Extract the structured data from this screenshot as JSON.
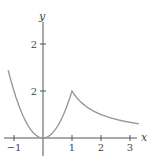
{
  "chart_data": {
    "type": "line",
    "title": "",
    "xlabel": "x",
    "ylabel": "y",
    "xlim": [
      -1.3,
      3.35
    ],
    "ylim": [
      -0.6,
      3.6
    ],
    "grid": false,
    "legend": null,
    "x_ticks": [
      {
        "value": -1,
        "label": "−1"
      },
      {
        "value": 1,
        "label": "1"
      },
      {
        "value": 2,
        "label": "2"
      },
      {
        "value": 3,
        "label": "3"
      }
    ],
    "y_ticks": [
      {
        "value": 2,
        "label": "2"
      },
      {
        "value": 4,
        "label": "2"
      }
    ],
    "series": [
      {
        "name": "f(x)",
        "color": "#999999",
        "description": "2x^2 for x<=1, 2/x for x>1",
        "points": [
          [
            -1.2,
            2.88
          ],
          [
            -1.0,
            2.0
          ],
          [
            -0.8,
            1.28
          ],
          [
            -0.6,
            0.72
          ],
          [
            -0.4,
            0.32
          ],
          [
            -0.2,
            0.08
          ],
          [
            0.0,
            0.0
          ],
          [
            0.2,
            0.08
          ],
          [
            0.4,
            0.32
          ],
          [
            0.6,
            0.72
          ],
          [
            0.8,
            1.28
          ],
          [
            1.0,
            2.0
          ],
          [
            1.25,
            1.6
          ],
          [
            1.5,
            1.333
          ],
          [
            1.75,
            1.143
          ],
          [
            2.0,
            1.0
          ],
          [
            2.5,
            0.8
          ],
          [
            3.0,
            0.667
          ],
          [
            3.3,
            0.606
          ]
        ]
      }
    ]
  }
}
